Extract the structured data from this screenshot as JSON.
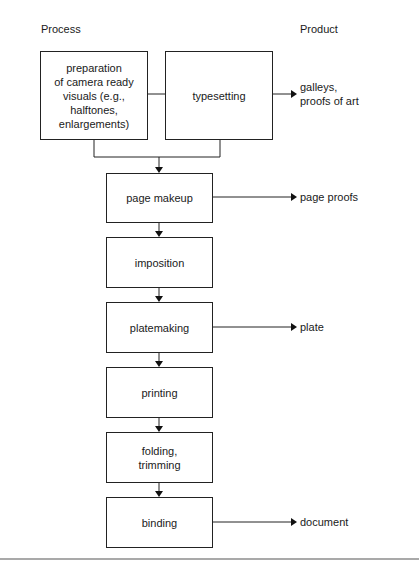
{
  "headers": {
    "process": "Process",
    "product": "Product"
  },
  "process_steps": [
    {
      "id": "prep",
      "label": "preparation\nof camera ready\nvisuals (e.g.,\nhalftones,\nenlargements)"
    },
    {
      "id": "typesetting",
      "label": "typesetting"
    },
    {
      "id": "page_makeup",
      "label": "page makeup"
    },
    {
      "id": "imposition",
      "label": "imposition"
    },
    {
      "id": "platemaking",
      "label": "platemaking"
    },
    {
      "id": "printing",
      "label": "printing"
    },
    {
      "id": "folding",
      "label": "folding,\ntrimming"
    },
    {
      "id": "binding",
      "label": "binding"
    }
  ],
  "products": [
    {
      "from": "typesetting",
      "label": "galleys,\nproofs of art"
    },
    {
      "from": "page_makeup",
      "label": "page proofs"
    },
    {
      "from": "platemaking",
      "label": "plate"
    },
    {
      "from": "binding",
      "label": "document"
    }
  ]
}
